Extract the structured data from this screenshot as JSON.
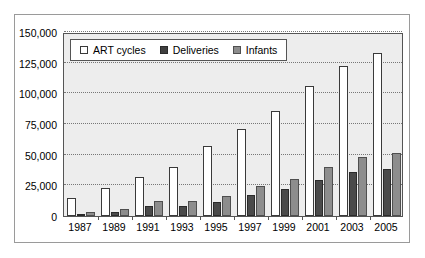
{
  "chart_data": {
    "type": "bar",
    "title": "",
    "xlabel": "",
    "ylabel": "",
    "categories": [
      "1987",
      "1989",
      "1991",
      "1993",
      "1995",
      "1997",
      "1999",
      "2001",
      "2003",
      "2005"
    ],
    "series": [
      {
        "name": "ART cycles",
        "color": "#ffffff",
        "values": [
          15000,
          23000,
          32000,
          40000,
          57000,
          71000,
          86000,
          106000,
          122000,
          133000
        ]
      },
      {
        "name": "Deliveries",
        "color": "#4a4a4a",
        "values": [
          2000,
          3500,
          8000,
          8000,
          11500,
          17000,
          22000,
          29000,
          36000,
          38000
        ]
      },
      {
        "name": "Infants",
        "color": "#8d8d8d",
        "values": [
          3000,
          5500,
          12500,
          12500,
          16000,
          24500,
          30000,
          40000,
          48500,
          51000
        ]
      }
    ],
    "ylim": [
      0,
      150000
    ],
    "ytick_labels": [
      "0",
      "25,000",
      "50,000",
      "75,000",
      "100,000",
      "125,000",
      "150,000"
    ],
    "ytick_values": [
      0,
      25000,
      50000,
      75000,
      100000,
      125000,
      150000
    ],
    "grid": true,
    "legend_position": "top-left"
  },
  "legend": {
    "items": [
      {
        "label": "ART cycles"
      },
      {
        "label": "Deliveries"
      },
      {
        "label": "Infants"
      }
    ]
  },
  "colors": {
    "plot_background": "#ededed",
    "figure_background": "#ffffff",
    "axis_line": "#555555",
    "gridline": "#777777",
    "frame": "#9a9a9a"
  }
}
